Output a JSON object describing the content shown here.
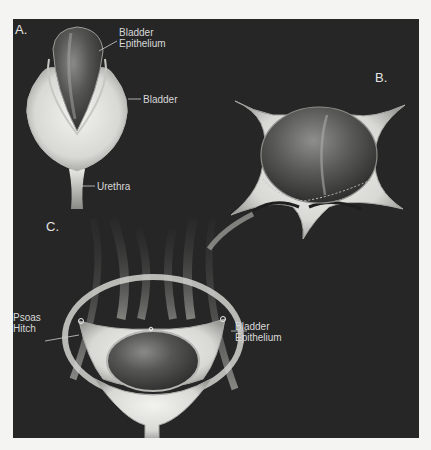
{
  "figure": {
    "panels": [
      {
        "id": "A",
        "letter": "A.",
        "labels": [
          {
            "text": "Bladder\nEpithelium",
            "target": "bladder-epithelium"
          },
          {
            "text": "Bladder",
            "target": "bladder"
          },
          {
            "text": "Urethra",
            "target": "urethra"
          }
        ]
      },
      {
        "id": "B",
        "letter": "B.",
        "labels": []
      },
      {
        "id": "C",
        "letter": "C.",
        "labels": [
          {
            "text": "Psoas\nHitch",
            "target": "psoas-hitch"
          },
          {
            "text": "Bladder\nEpithelium",
            "target": "bladder-epithelium"
          }
        ]
      }
    ],
    "colors": {
      "page_background": "#f4f4f2",
      "panel_background": "#262626",
      "tissue_light": "#e6e6e2",
      "epithelium_dark": "#4a4a4a",
      "label_text": "#d8d8d8"
    }
  }
}
